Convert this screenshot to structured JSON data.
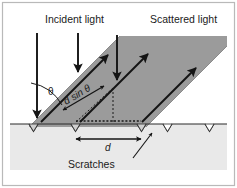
{
  "figure": {
    "kind": "optics-diffraction-grating-diagram",
    "labels": {
      "incident_light": "Incident light",
      "scattered_light": "Scattered light",
      "theta": "θ",
      "path_difference": "d sin θ",
      "spacing": "d",
      "scratches": "Scratches"
    },
    "colors": {
      "background": "#ffffff",
      "frame_border": "#b8b8b8",
      "substrate": "#e9e9e9",
      "beam": "#9b9b9b",
      "beam_edge": "#7d7d7d",
      "line": "#1a1a1a",
      "text": "#1a1a1a"
    },
    "geometry": {
      "surface_y": 124,
      "scratch_count": 4,
      "incident_arrow_count": 3,
      "scattered_arrow_count": 3,
      "beam_angle_deg": 45
    }
  }
}
